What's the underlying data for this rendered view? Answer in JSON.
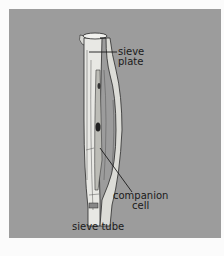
{
  "diagram": {
    "labels": {
      "sieve_plate": [
        "sieve",
        "plate"
      ],
      "companion_cell": [
        "companion",
        "cell"
      ],
      "sieve_tube": [
        "sieve tube"
      ]
    },
    "colors": {
      "background": "#9c9c9c",
      "tube_fill": "#e6e6e2",
      "outline": "#2a2a2a",
      "page": "#fbfbfb"
    }
  }
}
